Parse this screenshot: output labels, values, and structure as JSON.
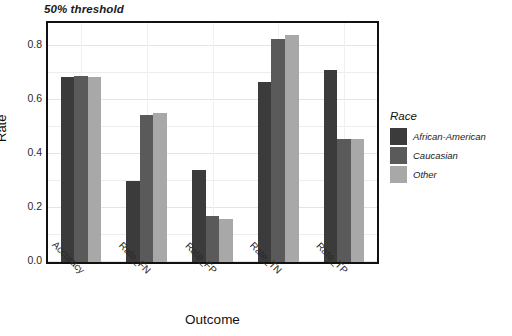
{
  "chart_data": {
    "type": "bar",
    "title": "50% threshold",
    "xlabel": "Outcome",
    "ylabel": "Rate",
    "categories": [
      "Accuracy",
      "Rate_FN",
      "Rate_FP",
      "Rate_TN",
      "Rate_TP"
    ],
    "series": [
      {
        "name": "African-American",
        "color": "#3b3b3b",
        "values": [
          0.685,
          0.3,
          0.34,
          0.665,
          0.71
        ]
      },
      {
        "name": "Caucasian",
        "color": "#5a5a5a",
        "values": [
          0.69,
          0.545,
          0.17,
          0.825,
          0.455
        ]
      },
      {
        "name": "Other",
        "color": "#a8a8a8",
        "values": [
          0.685,
          0.55,
          0.16,
          0.84,
          0.455
        ]
      }
    ],
    "ylim": [
      0.0,
      0.885
    ],
    "yticks": [
      0.0,
      0.2,
      0.4,
      0.6,
      0.8
    ],
    "ytick_labels": [
      "0.0",
      "0.2",
      "0.4",
      "0.6",
      "0.8"
    ],
    "grid": true,
    "legend_position": "right",
    "legend_title": "Race"
  },
  "legend": {
    "title": "Race",
    "entries": [
      {
        "label": "African-American",
        "color": "#3b3b3b"
      },
      {
        "label": "Caucasian",
        "color": "#5a5a5a"
      },
      {
        "label": "Other",
        "color": "#a8a8a8"
      }
    ]
  }
}
